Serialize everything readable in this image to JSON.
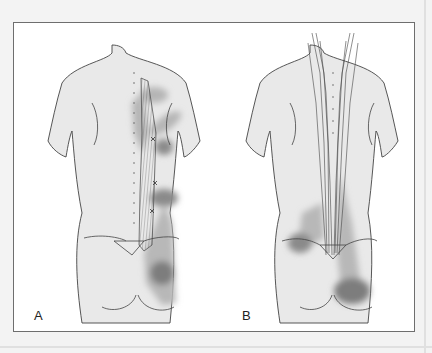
{
  "figure": {
    "panels": [
      {
        "id": "A",
        "label": "A",
        "description": "Posterior torso view with single longitudinal muscle (left paraspinal, iliocostalis) hatched, trigger points marked with X, and shaded referred pain zones over scapula, flank and buttock"
      },
      {
        "id": "B",
        "label": "B",
        "description": "Posterior torso view with bilateral paraspinal muscle bundles (multifidus/longissimus) hatched from neck to sacrum, shaded referred pain zones over lower back, sacrum, and buttock"
      }
    ],
    "colors": {
      "background": "#f3f3f3",
      "frame_border": "#6e6e6e",
      "body_fill": "#e9e9e9",
      "body_outline": "#444444",
      "pain_light": "#b9b9b9",
      "pain_dark": "#8a8a8a",
      "muscle_hatch": "#555555"
    }
  }
}
